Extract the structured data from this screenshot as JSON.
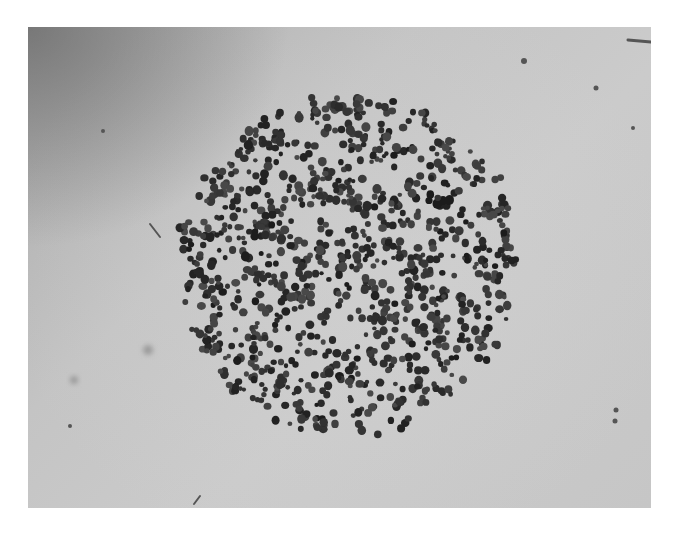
{
  "image": {
    "description": "Grayscale microscope photograph of a circular colony of dark, round spots on a light gray background",
    "frame": {
      "left": 28,
      "top": 27,
      "width": 623,
      "height": 481
    },
    "colors": {
      "background_light": "#c9c9c9",
      "background_dark_corner": "#8a8a8a",
      "dot": "#2a2a2a",
      "dot_halo": "#5a5a5a",
      "debris": "#555555"
    }
  },
  "cluster": {
    "center_x": 319,
    "center_y": 238,
    "radius": 172,
    "dot_count": 900,
    "dot_radius_min": 2.2,
    "dot_radius_max": 4.6,
    "seed": 1337
  },
  "debris": [
    {
      "type": "streak",
      "x1": 122,
      "y1": 197,
      "x2": 132,
      "y2": 210,
      "width": 2
    },
    {
      "type": "speck",
      "x": 496,
      "y": 34,
      "r": 3
    },
    {
      "type": "speck",
      "x": 568,
      "y": 61,
      "r": 2.5
    },
    {
      "type": "speck",
      "x": 605,
      "y": 101,
      "r": 2
    },
    {
      "type": "speck",
      "x": 587,
      "y": 394,
      "r": 2.5
    },
    {
      "type": "speck",
      "x": 588,
      "y": 383,
      "r": 2.5
    },
    {
      "type": "speck",
      "x": 120,
      "y": 323,
      "r": 5,
      "faint": true
    },
    {
      "type": "speck",
      "x": 46,
      "y": 353,
      "r": 4,
      "faint": true
    },
    {
      "type": "speck",
      "x": 42,
      "y": 399,
      "r": 2
    },
    {
      "type": "streak",
      "x1": 166,
      "y1": 477,
      "x2": 172,
      "y2": 469,
      "width": 2
    },
    {
      "type": "streak",
      "x1": 600,
      "y1": 13,
      "x2": 623,
      "y2": 15,
      "width": 3
    },
    {
      "type": "speck",
      "x": 75,
      "y": 104,
      "r": 2
    }
  ]
}
